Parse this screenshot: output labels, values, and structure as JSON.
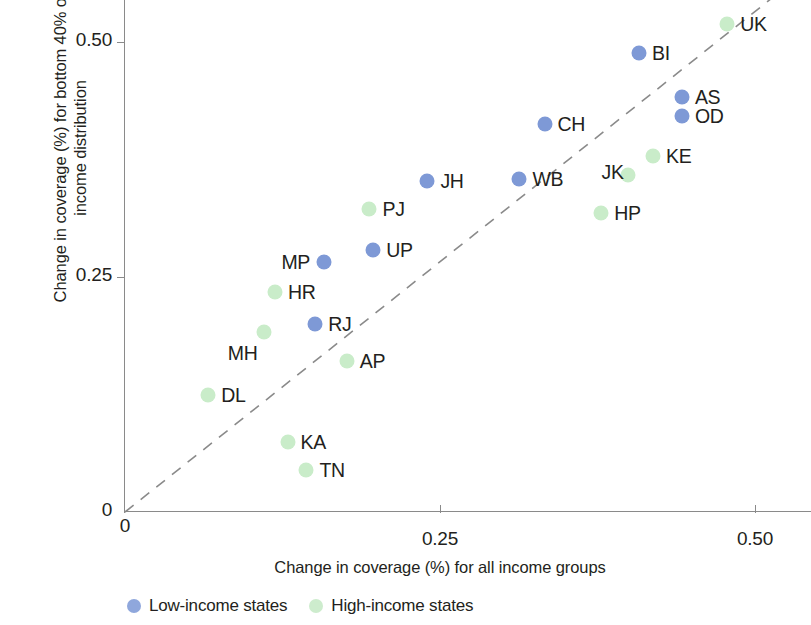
{
  "chart_data": {
    "type": "scatter",
    "title": "",
    "xlabel": "Change in coverage (%) for all income groups",
    "ylabel": "Change in coverage (%) for bottom 40% of income distribution",
    "ylabel_line1": "Change in coverage (%) for bottom 40% of",
    "ylabel_line2": "income distribution",
    "xlim": [
      0,
      0.545
    ],
    "ylim": [
      0,
      0.545
    ],
    "grid": false,
    "xticks": [
      0,
      0.25,
      0.5
    ],
    "xticklabels": [
      "0",
      "0.25",
      "0.50"
    ],
    "yticks": [
      0,
      0.25,
      0.5
    ],
    "yticklabels": [
      "0",
      "0.25",
      "0.50"
    ],
    "reference_line": {
      "type": "identity",
      "style": "dashed",
      "label": "y = x",
      "color": "#8a8a8a"
    },
    "legend": {
      "position": "below-axis",
      "entries": [
        {
          "name": "Low-income states",
          "color": "#8fa7dc",
          "key": "low"
        },
        {
          "name": "High-income states",
          "color": "#cdeccd",
          "key": "high"
        }
      ]
    },
    "series": [
      {
        "name": "Low-income states",
        "key": "low",
        "color": "#7e99d6",
        "points": [
          {
            "label": "BI",
            "x": 0.408,
            "y": 0.488,
            "lpos": "right"
          },
          {
            "label": "AS",
            "x": 0.442,
            "y": 0.441,
            "lpos": "right"
          },
          {
            "label": "OD",
            "x": 0.442,
            "y": 0.421,
            "lpos": "right"
          },
          {
            "label": "CH",
            "x": 0.333,
            "y": 0.413,
            "lpos": "right"
          },
          {
            "label": "JH",
            "x": 0.24,
            "y": 0.352,
            "lpos": "right"
          },
          {
            "label": "WB",
            "x": 0.313,
            "y": 0.354,
            "lpos": "right"
          },
          {
            "label": "UP",
            "x": 0.197,
            "y": 0.279,
            "lpos": "right"
          },
          {
            "label": "MP",
            "x": 0.158,
            "y": 0.266,
            "lpos": "left"
          },
          {
            "label": "RJ",
            "x": 0.151,
            "y": 0.2,
            "lpos": "right"
          }
        ]
      },
      {
        "name": "High-income states",
        "key": "high",
        "color": "#c9ecc9",
        "points": [
          {
            "label": "UK",
            "x": 0.478,
            "y": 0.519,
            "lpos": "right"
          },
          {
            "label": "KE",
            "x": 0.419,
            "y": 0.379,
            "lpos": "right"
          },
          {
            "label": "JK",
            "x": 0.399,
            "y": 0.358,
            "lpos": "upleft"
          },
          {
            "label": "HP",
            "x": 0.378,
            "y": 0.318,
            "lpos": "right"
          },
          {
            "label": "PJ",
            "x": 0.194,
            "y": 0.322,
            "lpos": "right"
          },
          {
            "label": "HR",
            "x": 0.119,
            "y": 0.234,
            "lpos": "right"
          },
          {
            "label": "MH",
            "x": 0.11,
            "y": 0.191,
            "lpos": "belowleft"
          },
          {
            "label": "AP",
            "x": 0.176,
            "y": 0.161,
            "lpos": "right"
          },
          {
            "label": "DL",
            "x": 0.066,
            "y": 0.124,
            "lpos": "right"
          },
          {
            "label": "KA",
            "x": 0.129,
            "y": 0.074,
            "lpos": "right"
          },
          {
            "label": "TN",
            "x": 0.144,
            "y": 0.045,
            "lpos": "right"
          }
        ]
      }
    ]
  }
}
